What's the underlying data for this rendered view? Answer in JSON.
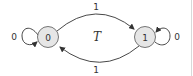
{
  "diagram": {
    "title": "T",
    "nodes": [
      {
        "id": "s0",
        "label": "0"
      },
      {
        "id": "s1",
        "label": "1"
      }
    ],
    "edges": [
      {
        "from": "s0",
        "to": "s0",
        "label": "0",
        "kind": "self-loop"
      },
      {
        "from": "s0",
        "to": "s1",
        "label": "1",
        "kind": "arc-top"
      },
      {
        "from": "s1",
        "to": "s0",
        "label": "1",
        "kind": "arc-bottom"
      },
      {
        "from": "s1",
        "to": "s1",
        "label": "0",
        "kind": "self-loop"
      }
    ],
    "colors": {
      "node_fill": "#e6e6e6",
      "node_stroke": "#666666",
      "edge": "#333333",
      "border": "#d9d9d9"
    }
  }
}
